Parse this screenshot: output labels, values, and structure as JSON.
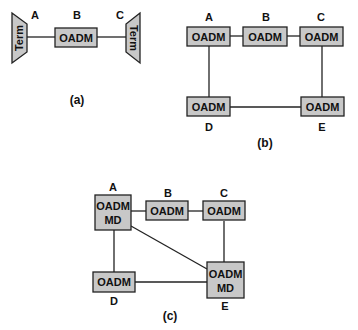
{
  "colors": {
    "node_fill": "#c8c8c8",
    "stroke": "#222222",
    "background": "#ffffff"
  },
  "panel_a": {
    "caption": "(a)",
    "labels": {
      "a": "A",
      "b": "B",
      "c": "C"
    },
    "term_left": "Term",
    "term_right": "Term",
    "node_b": "OADM"
  },
  "panel_b": {
    "caption": "(b)",
    "labels": {
      "a": "A",
      "b": "B",
      "c": "C",
      "d": "D",
      "e": "E"
    },
    "nodes": {
      "a": "OADM",
      "b": "OADM",
      "c": "OADM",
      "d": "OADM",
      "e": "OADM"
    }
  },
  "panel_c": {
    "caption": "(c)",
    "labels": {
      "a": "A",
      "b": "B",
      "c": "C",
      "d": "D",
      "e": "E"
    },
    "nodes": {
      "a_line1": "OADM",
      "a_line2": "MD",
      "b": "OADM",
      "c": "OADM",
      "d": "OADM",
      "e_line1": "OADM",
      "e_line2": "MD"
    }
  }
}
